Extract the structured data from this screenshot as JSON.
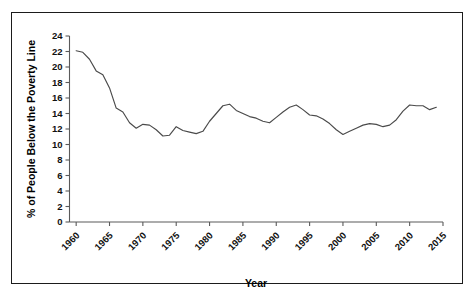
{
  "figure": {
    "border_color": "#1b1b1b",
    "background": "#ffffff",
    "line_color": "#4a4a4a"
  },
  "chart_data": {
    "type": "line",
    "title": "",
    "xlabel": "Year",
    "ylabel": "% of People Below the Poverty Line",
    "xlim": [
      1959,
      2015
    ],
    "ylim": [
      0,
      24
    ],
    "ytick_labels": [
      "0",
      "2",
      "4",
      "6",
      "8",
      "10",
      "12",
      "14",
      "16",
      "18",
      "20",
      "22",
      "24"
    ],
    "yticks": [
      0,
      2,
      4,
      6,
      8,
      10,
      12,
      14,
      16,
      18,
      20,
      22,
      24
    ],
    "xtick_labels": [
      "1960",
      "1965",
      "1970",
      "1975",
      "1980",
      "1985",
      "1990",
      "1995",
      "2000",
      "2005",
      "2010",
      "2015"
    ],
    "xticks": [
      1960,
      1965,
      1970,
      1975,
      1980,
      1985,
      1990,
      1995,
      2000,
      2005,
      2010,
      2015
    ],
    "xtick_rotation": 45,
    "grid": false,
    "legend": "none",
    "series": [
      {
        "name": "% of People Below the Poverty Line",
        "x": [
          1960,
          1961,
          1962,
          1963,
          1964,
          1965,
          1966,
          1967,
          1968,
          1969,
          1970,
          1971,
          1972,
          1973,
          1974,
          1975,
          1976,
          1977,
          1978,
          1979,
          1980,
          1981,
          1982,
          1983,
          1984,
          1985,
          1986,
          1987,
          1988,
          1989,
          1990,
          1991,
          1992,
          1993,
          1994,
          1995,
          1996,
          1997,
          1998,
          1999,
          2000,
          2001,
          2002,
          2003,
          2004,
          2005,
          2006,
          2007,
          2008,
          2009,
          2010,
          2011,
          2012,
          2013,
          2014
        ],
        "values": [
          22.1,
          21.9,
          21.0,
          19.5,
          19.0,
          17.3,
          14.7,
          14.2,
          12.8,
          12.1,
          12.6,
          12.5,
          11.9,
          11.1,
          11.2,
          12.3,
          11.8,
          11.6,
          11.4,
          11.7,
          13.0,
          14.0,
          15.0,
          15.2,
          14.4,
          14.0,
          13.6,
          13.4,
          13.0,
          12.8,
          13.5,
          14.2,
          14.8,
          15.1,
          14.5,
          13.8,
          13.7,
          13.3,
          12.7,
          11.9,
          11.3,
          11.7,
          12.1,
          12.5,
          12.7,
          12.6,
          12.3,
          12.5,
          13.2,
          14.3,
          15.1,
          15.0,
          15.0,
          14.5,
          14.8
        ]
      }
    ]
  },
  "labels": {
    "y_axis_title": "% of People Below the Poverty Line",
    "x_axis_title": "Year"
  }
}
